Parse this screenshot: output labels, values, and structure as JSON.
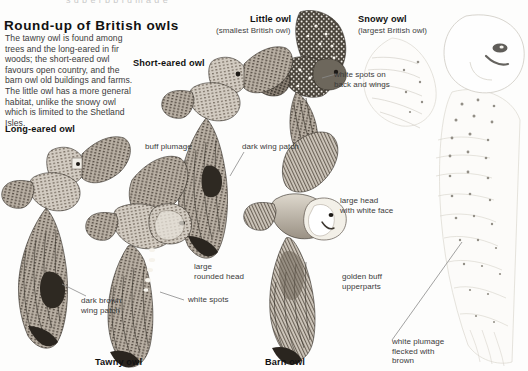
{
  "page": {
    "clipped_top_text": "s u p e r b   p l u m a g e",
    "headline": "Round-up of British owls",
    "intro": "The tawny owl is found among trees and the long-eared in fir woods; the short-eared owl favours open country, and the barn owl old buildings and farms. The little owl has a more general habitat, unlike the snowy owl which is limited to the Shetland Isles.",
    "background_color": "#fdfdfc",
    "ink_color": "#3b3b3b",
    "leader_line_color": "#8a8a8a"
  },
  "species": [
    {
      "id": "little",
      "name": "Little owl",
      "subtitle": "(smallest British owl)"
    },
    {
      "id": "snowy",
      "name": "Snowy owl",
      "subtitle": "(largest British owl)"
    },
    {
      "id": "short_eared",
      "name": "Short-eared owl",
      "subtitle": ""
    },
    {
      "id": "long_eared",
      "name": "Long-eared owl",
      "subtitle": ""
    },
    {
      "id": "tawny",
      "name": "Tawny owl",
      "subtitle": ""
    },
    {
      "id": "barn",
      "name": "Barn owl",
      "subtitle": ""
    }
  ],
  "annotations": [
    {
      "id": "white_spots_back",
      "text": "white spots on\nback and wings"
    },
    {
      "id": "buff_plumage",
      "text": "buff plumage"
    },
    {
      "id": "dark_wing_patch",
      "text": "dark wing patch"
    },
    {
      "id": "large_head_white",
      "text": "large head\nwith white face"
    },
    {
      "id": "large_rounded_head",
      "text": "large\nrounded head"
    },
    {
      "id": "golden_buff",
      "text": "golden buff\nupperparts"
    },
    {
      "id": "dark_brown_patch",
      "text": "dark brown\nwing patch"
    },
    {
      "id": "white_spots",
      "text": "white spots"
    },
    {
      "id": "white_flecked",
      "text": "white plumage\nflecked with\nbrown"
    }
  ]
}
